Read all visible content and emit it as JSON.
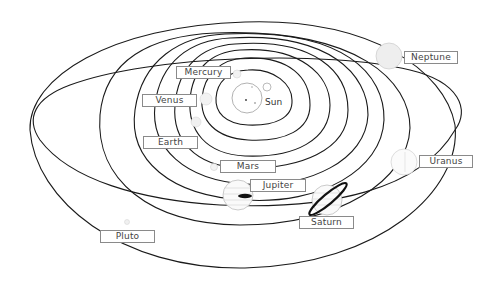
{
  "diagram": {
    "colors": {
      "orbit": "#1a1a1a",
      "planet_outline": "#bdbdbd",
      "label_border": "#8a8a8a",
      "label_text": "#444444",
      "saturn_ring": "#111111"
    },
    "sun": {
      "label": "Sun"
    },
    "planets": [
      {
        "name": "Mercury",
        "label": "Mercury"
      },
      {
        "name": "Venus",
        "label": "Venus"
      },
      {
        "name": "Earth",
        "label": "Earth"
      },
      {
        "name": "Mars",
        "label": "Mars"
      },
      {
        "name": "Jupiter",
        "label": "Jupiter"
      },
      {
        "name": "Saturn",
        "label": "Saturn"
      },
      {
        "name": "Uranus",
        "label": "Uranus"
      },
      {
        "name": "Neptune",
        "label": "Neptune"
      },
      {
        "name": "Pluto",
        "label": "Pluto"
      }
    ]
  }
}
